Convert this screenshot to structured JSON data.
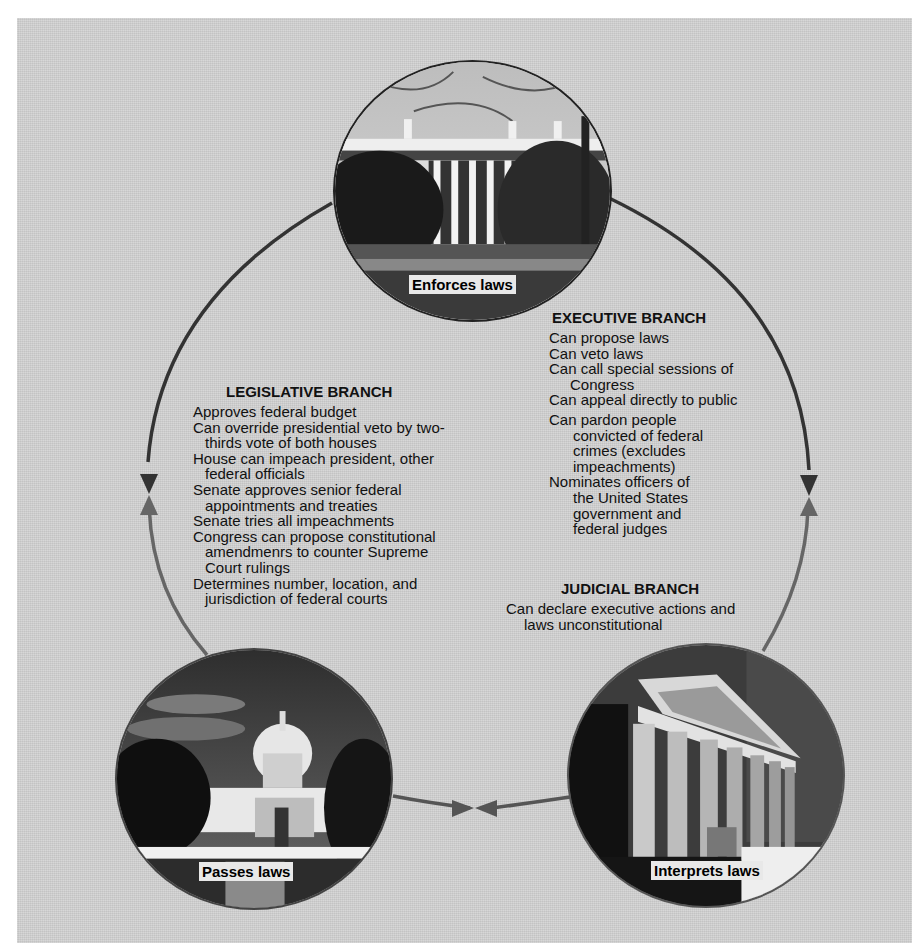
{
  "diagram": {
    "arc_colors": {
      "upper": "#333333",
      "lower": "#666666"
    },
    "background_color": "#cfcfcf"
  },
  "nodes": {
    "executive": {
      "photo": "White House",
      "caption": "Enforces laws"
    },
    "legislative": {
      "photo": "U.S. Capitol",
      "caption": "Passes laws"
    },
    "judicial": {
      "photo": "Supreme Court",
      "caption": "Interprets laws"
    }
  },
  "legislative_branch": {
    "heading": "LEGISLATIVE BRANCH",
    "items": [
      {
        "line1": "Approves federal budget"
      },
      {
        "line1": "Can override presidential veto by  two-",
        "line2": "thirds vote of both houses"
      },
      {
        "line1": "House can impeach president, other",
        "line2": "federal officials"
      },
      {
        "line1": "Senate approves senior federal",
        "line2": "appointments and treaties"
      },
      {
        "line1": "Senate tries all impeachments"
      },
      {
        "line1": "Congress can propose constitutional",
        "line2": "amendmenrs to counter Supreme",
        "line3": "Court rulings"
      },
      {
        "line1": "Determines number, location, and",
        "line2": "jurisdiction of federal courts"
      }
    ]
  },
  "executive_branch": {
    "heading": "EXECUTIVE BRANCH",
    "items": [
      {
        "line1": "Can propose laws"
      },
      {
        "line1": "Can veto laws"
      },
      {
        "line1": "Can call special sessions of",
        "line2": "Congress"
      },
      {
        "line1": "Can appeal directly to public"
      },
      {
        "line1": "Can pardon people",
        "line2": "convicted of federal",
        "line3": "crimes (excludes",
        "line4": "impeachments)"
      },
      {
        "line1": "Nominates officers of",
        "line2": "the United States",
        "line3": "government and",
        "line4": "federal judges"
      }
    ]
  },
  "judicial_branch": {
    "heading": "JUDICIAL BRANCH",
    "items": [
      {
        "line1": "Can declare executive actions and",
        "line2": "laws unconstitutional"
      }
    ]
  },
  "arrows": [
    {
      "name": "legislative-executive",
      "position": "left",
      "direction": "meeting"
    },
    {
      "name": "executive-judicial",
      "position": "right",
      "direction": "meeting"
    },
    {
      "name": "legislative-judicial",
      "position": "bottom",
      "direction": "meeting"
    }
  ]
}
